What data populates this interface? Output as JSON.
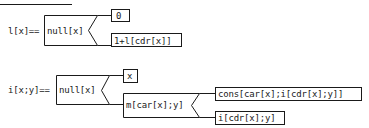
{
  "diagrams": [
    {
      "id": "length",
      "definition": "l[x]==",
      "condition": "null[x]",
      "branches": [
        {
          "label": "0"
        },
        {
          "label": "1+l[cdr[x]]"
        }
      ]
    },
    {
      "id": "interleave",
      "definition": "i[x;y]==",
      "condition": "null[x]",
      "branches": [
        {
          "label": "x"
        },
        {
          "label": "m[car[x];y]",
          "branches": [
            {
              "label": "cons[car[x];i[cdr[x];y]]"
            },
            {
              "label": "i[cdr[x];y]"
            }
          ]
        }
      ]
    }
  ]
}
